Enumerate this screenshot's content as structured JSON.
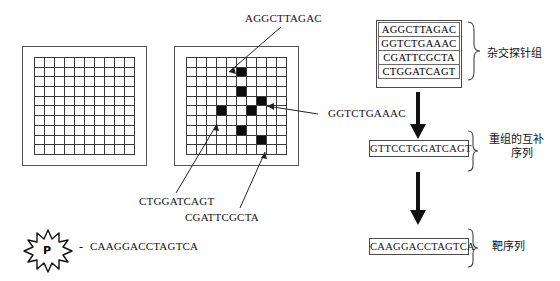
{
  "diagram": {
    "arrays": {
      "blank_array": {
        "name": "blank microarray",
        "rows": 10,
        "cols": 10,
        "filled_cells": []
      },
      "hybridized_array": {
        "name": "hybridized microarray",
        "rows": 10,
        "cols": 10,
        "filled_cells": [
          {
            "row": 1,
            "col": 5
          },
          {
            "row": 3,
            "col": 5
          },
          {
            "row": 4,
            "col": 7
          },
          {
            "row": 5,
            "col": 3
          },
          {
            "row": 5,
            "col": 6
          },
          {
            "row": 7,
            "col": 5
          },
          {
            "row": 8,
            "col": 7
          }
        ]
      }
    },
    "callouts": {
      "top": "AGGCTTAGAC",
      "right": "GGTCTGAAAC",
      "bottom_left": "CTGGATCAGT",
      "bottom_right": "CGATTCGCTA"
    },
    "label_probe": {
      "marker": "P",
      "dash": "-",
      "sequence": "CAAGGACCTAGTCA"
    },
    "probe_set": {
      "label": "杂交探针组",
      "sequences": [
        "AGGCTTAGAC",
        "GGTCTGAAAC",
        "CGATTCGCTA",
        "CTGGATCAGT"
      ]
    },
    "recombined": {
      "label_line1": "重组的互补",
      "label_line2": "序列",
      "sequence": "GTTCCTGGATCAGT"
    },
    "target": {
      "label": "靶序列",
      "sequence": "CAAGGACCTAGTCA"
    },
    "colors": {
      "ink": "#111111",
      "spot": "#0c0c0c",
      "grid_line": "#3a3a3a",
      "frame": "#555555"
    }
  }
}
